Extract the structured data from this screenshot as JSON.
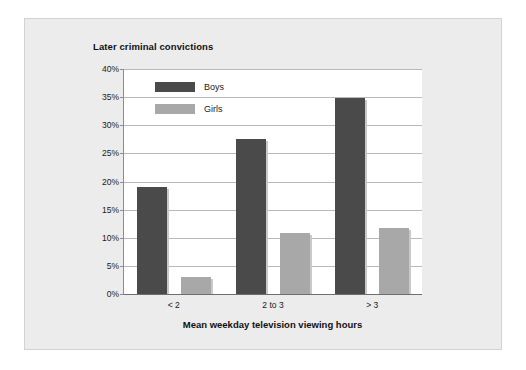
{
  "chart_data": {
    "type": "bar",
    "title": "Later criminal convictions",
    "xlabel": "Mean weekday television viewing hours",
    "ylabel": "",
    "categories": [
      "< 2",
      "2 to 3",
      "> 3"
    ],
    "series": [
      {
        "name": "Boys",
        "color": "#4a4a4a",
        "values": [
          19,
          27.5,
          34.8
        ]
      },
      {
        "name": "Girls",
        "color": "#a8a8a8",
        "values": [
          3,
          10.8,
          11.8
        ]
      }
    ],
    "ylim": [
      0,
      40
    ],
    "ytick_labels": [
      "0%",
      "5%",
      "10%",
      "15%",
      "20%",
      "25%",
      "30%",
      "35%",
      "40%"
    ],
    "ytick_values": [
      0,
      5,
      10,
      15,
      20,
      25,
      30,
      35,
      40
    ],
    "grid": true,
    "legend_position": "top-left-inside"
  }
}
